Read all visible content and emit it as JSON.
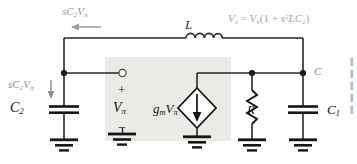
{
  "figure": {
    "type": "circuit-schematic",
    "background": "#ffffff",
    "wire_color": "#262626",
    "shaded_box_color": "#eceae7"
  },
  "labels": {
    "top_left_current": {
      "text": "sC2Vπ",
      "base": "sC",
      "sub": "2",
      "tail": "V",
      "tail_sub": "π",
      "color": "#9a9a9f"
    },
    "vx_equation": {
      "lhs": "V",
      "lhs_sub": "x",
      "eq": "=",
      "rhs_v": "V",
      "rhs_sub": "π",
      "rhs_rest": "(1 + s",
      "exp": "2",
      "rhs_tail": "LC",
      "rhs_tail_sub": "2",
      "close": ")",
      "color": "#a2a2a7"
    },
    "inductor": {
      "text": "L",
      "color": "#2a2a2a"
    },
    "c2_branch_current": {
      "base": "sC",
      "sub": "2",
      "tail": "V",
      "tail_sub": "π",
      "color": "#8b8b90"
    },
    "c2": {
      "base": "C",
      "sub": "2",
      "color": "#111111"
    },
    "polarity_plus": {
      "text": "+",
      "color": "#222222"
    },
    "vpi": {
      "base": "V",
      "sub": "π",
      "color": "#111111"
    },
    "polarity_minus": {
      "text": "−",
      "color": "#222222"
    },
    "gm_vpi": {
      "base": "g",
      "sub": "m",
      "tail": "V",
      "tail_sub": "π",
      "color": "#111111"
    },
    "resistor": {
      "text": "R",
      "color": "#111111"
    },
    "node_c": {
      "text": "C",
      "color": "#7d7d82"
    },
    "c1": {
      "base": "C",
      "sub": "1",
      "color": "#111111"
    }
  },
  "components": [
    {
      "name": "inductor-L",
      "kind": "inductor",
      "label": "L",
      "orientation": "horizontal"
    },
    {
      "name": "capacitor-C2",
      "kind": "capacitor",
      "label": "C2",
      "orientation": "vertical"
    },
    {
      "name": "capacitor-C1",
      "kind": "capacitor",
      "label": "C1",
      "orientation": "vertical"
    },
    {
      "name": "resistor-R",
      "kind": "resistor",
      "label": "R",
      "orientation": "vertical"
    },
    {
      "name": "current-source-gm",
      "kind": "current-source",
      "label": "gmVπ",
      "orientation": "vertical",
      "arrow": "down"
    }
  ],
  "nodes": [
    {
      "name": "node-left",
      "label": ""
    },
    {
      "name": "node-input-terminal",
      "label": "",
      "style": "open-circle"
    },
    {
      "name": "node-r",
      "label": ""
    },
    {
      "name": "node-c",
      "label": "C"
    }
  ],
  "grounds": [
    "ground-c2",
    "ground-vpi",
    "ground-source",
    "ground-r",
    "ground-c1"
  ],
  "arrows": [
    {
      "name": "arrow-top-left",
      "direction": "left",
      "label": "sC2Vπ"
    },
    {
      "name": "arrow-c2-branch",
      "direction": "down",
      "label": "sC2Vπ"
    },
    {
      "name": "arrow-source-internal",
      "direction": "down",
      "label": ""
    }
  ],
  "edge_fragments": [
    "▌",
    "▌",
    "▌",
    "▌",
    "▌"
  ]
}
